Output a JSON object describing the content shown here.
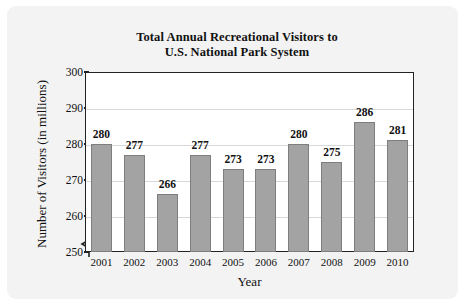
{
  "chart_data": {
    "type": "bar",
    "title": "Total Annual Recreational Visitors to U.S. National Park System",
    "title_line1": "Total Annual Recreational Visitors to",
    "title_line2": "U.S. National Park System",
    "xlabel": "Year",
    "ylabel": "Number of Visitors  (in millions)",
    "categories": [
      "2001",
      "2002",
      "2003",
      "2004",
      "2005",
      "2006",
      "2007",
      "2008",
      "2009",
      "2010"
    ],
    "values": [
      280,
      277,
      266,
      277,
      273,
      273,
      280,
      275,
      286,
      281
    ],
    "data_labels": [
      "280",
      "277",
      "266",
      "277",
      "273",
      "273",
      "280",
      "275",
      "286",
      "281"
    ],
    "ylim": [
      250,
      300
    ],
    "yticks": [
      250,
      260,
      270,
      280,
      290,
      300
    ],
    "ytick_labels": [
      "250",
      "260",
      "270",
      "280",
      "290",
      "300"
    ],
    "grid": true,
    "grid_axis": "y",
    "legend": null,
    "axis_break": true,
    "axis_break_note": "zigzag break on y-axis below 250",
    "bar_color": "#a3a3a3",
    "bar_edge_color": "#7e7e7e",
    "grid_color": "#d8d8d8",
    "frame_color": "#222222",
    "background": "#f3f3f3",
    "plot_background": "#ffffff"
  }
}
